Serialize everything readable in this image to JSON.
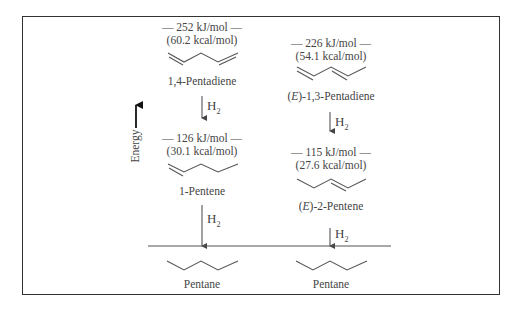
{
  "axis": {
    "label": "Energy"
  },
  "reagent": {
    "main": "H",
    "sub": "2"
  },
  "left_column": {
    "diene": {
      "energy_kj": "— 252 kJ/mol —",
      "energy_kcal": "(60.2 kcal/mol)",
      "name": "1,4-Pentadiene"
    },
    "alkene": {
      "energy_kj": "— 126 kJ/mol —",
      "energy_kcal": "(30.1 kcal/mol)",
      "name": "1-Pentene"
    },
    "alkane": {
      "name": "Pentane"
    }
  },
  "right_column": {
    "diene": {
      "energy_kj": "— 226 kJ/mol —",
      "energy_kcal": "(54.1 kcal/mol)",
      "name_prefix": "E",
      "name": "-1,3-Pentadiene"
    },
    "alkene": {
      "energy_kj": "— 115 kJ/mol —",
      "energy_kcal": "(27.6 kcal/mol)",
      "name_prefix": "E",
      "name": "-2-Pentene"
    },
    "alkane": {
      "name": "Pentane"
    }
  },
  "colors": {
    "line": "#444444",
    "frame": "#333333"
  }
}
